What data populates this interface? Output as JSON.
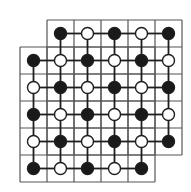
{
  "diagram": {
    "title": "",
    "cell_size": 27,
    "colors": {
      "background": "#ffffff",
      "grid_line": "#555555",
      "edge_line": "#1e1e1e",
      "black_node": "#1a1a1a",
      "white_node": "#ffffff",
      "node_stroke": "#1e1e1e"
    },
    "grids": [
      {
        "name": "upper-right-grid",
        "x": 47,
        "y": 20,
        "cols": 5,
        "rows": 5
      },
      {
        "name": "lower-left-grid",
        "x": 20,
        "y": 47,
        "cols": 5,
        "rows": 5
      }
    ],
    "node_origin": {
      "x": 33.5,
      "y": 33.5
    },
    "node_radius": 6,
    "node_rows": [
      {
        "row": 0,
        "cols": [
          1,
          2,
          3,
          4,
          5
        ],
        "colors": [
          "black",
          "white",
          "black",
          "white",
          "black"
        ]
      },
      {
        "row": 1,
        "cols": [
          0,
          1,
          2,
          3,
          4,
          5
        ],
        "colors": [
          "black",
          "white",
          "black",
          "white",
          "black",
          "white"
        ]
      },
      {
        "row": 2,
        "cols": [
          0,
          1,
          2,
          3,
          4,
          5
        ],
        "colors": [
          "white",
          "black",
          "white",
          "black",
          "white",
          "black"
        ]
      },
      {
        "row": 3,
        "cols": [
          0,
          1,
          2,
          3,
          4,
          5
        ],
        "colors": [
          "black",
          "white",
          "black",
          "white",
          "black",
          "white"
        ]
      },
      {
        "row": 4,
        "cols": [
          0,
          1,
          2,
          3,
          4,
          5
        ],
        "colors": [
          "white",
          "black",
          "white",
          "black",
          "white",
          "black"
        ]
      },
      {
        "row": 5,
        "cols": [
          0,
          1,
          2,
          3,
          4
        ],
        "colors": [
          "black",
          "white",
          "black",
          "white",
          "black"
        ]
      }
    ]
  }
}
